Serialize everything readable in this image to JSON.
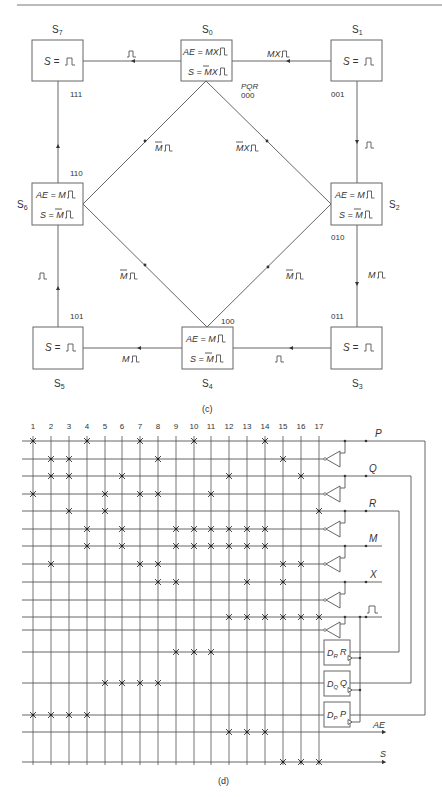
{
  "state_diagram": {
    "caption": "(c)",
    "code_header": "PQR",
    "states": [
      {
        "id": "S7",
        "name": "S",
        "sub": "7",
        "code": "111",
        "lines": [
          "S = ⎍"
        ],
        "x": 32,
        "y": 40,
        "name_pos": [
          57,
          30
        ],
        "code_pos": [
          70,
          95
        ]
      },
      {
        "id": "S0",
        "name": "S",
        "sub": "0",
        "code": "000",
        "lines": [
          "AE = MX⎍",
          "S = M̄X⎍"
        ],
        "x": 181,
        "y": 40,
        "name_pos": [
          206,
          30
        ],
        "code_pos": [
          240,
          95
        ]
      },
      {
        "id": "S1",
        "name": "S",
        "sub": "1",
        "code": "001",
        "lines": [
          "S = ⎍"
        ],
        "x": 331,
        "y": 40,
        "name_pos": [
          356,
          30
        ],
        "code_pos": [
          331,
          95
        ]
      },
      {
        "id": "S2",
        "name": "S",
        "sub": "2",
        "code": "010",
        "lines": [
          "AE = M⎍",
          "S = M̄⎍"
        ],
        "x": 331,
        "y": 183,
        "name_pos": [
          394,
          208
        ],
        "code_pos": [
          331,
          240
        ]
      },
      {
        "id": "S3",
        "name": "S",
        "sub": "3",
        "code": "011",
        "lines": [
          "S = ⎍"
        ],
        "x": 331,
        "y": 327,
        "name_pos": [
          356,
          385
        ],
        "code_pos": [
          331,
          318
        ]
      },
      {
        "id": "S4",
        "name": "S",
        "sub": "4",
        "code": "100",
        "lines": [
          "AE = M⎍",
          "S = M̄⎍"
        ],
        "x": 182,
        "y": 327,
        "name_pos": [
          206,
          385
        ],
        "code_pos": [
          221,
          322
        ]
      },
      {
        "id": "S5",
        "name": "S",
        "sub": "5",
        "code": "101",
        "lines": [
          "S = ⎍"
        ],
        "x": 33,
        "y": 327,
        "name_pos": [
          57,
          385
        ],
        "code_pos": [
          70,
          318
        ]
      },
      {
        "id": "S6",
        "name": "S",
        "sub": "6",
        "code": "110",
        "lines": [
          "AE = M⎍",
          "S = M̄⎍"
        ],
        "x": 32,
        "y": 183,
        "name_pos": [
          17,
          208
        ],
        "code_pos": [
          70,
          174
        ]
      }
    ],
    "transitions": [
      {
        "from": "S7",
        "to": "S0",
        "label": "⎍"
      },
      {
        "from": "S0",
        "to": "S1",
        "label": "MX⎍"
      },
      {
        "from": "S1",
        "to": "S2",
        "label": "⎍"
      },
      {
        "from": "S2",
        "to": "S3",
        "label": "M⎍"
      },
      {
        "from": "S3",
        "to": "S4",
        "label": "⎍"
      },
      {
        "from": "S4",
        "to": "S5",
        "label": "M⎍"
      },
      {
        "from": "S5",
        "to": "S6",
        "label": "⎍"
      },
      {
        "from": "S6",
        "to": "S7",
        "label": "⎍"
      },
      {
        "from": "S6",
        "to": "S0",
        "label": "M̄⎍"
      },
      {
        "from": "S2",
        "to": "S0",
        "label": "M̄X⎍"
      },
      {
        "from": "S4",
        "to": "S6",
        "label": "M̄⎍"
      },
      {
        "from": "S4",
        "to": "S2",
        "label": "M̄⎍"
      }
    ]
  },
  "crossbar": {
    "caption": "(d)",
    "columns": [
      "1",
      "2",
      "3",
      "4",
      "5",
      "6",
      "7",
      "8",
      "9",
      "10",
      "11",
      "12",
      "13",
      "14",
      "15",
      "16",
      "17"
    ],
    "rows": [
      {
        "name": "P",
        "crosses": [
          1,
          4,
          7,
          10,
          14
        ]
      },
      {
        "name": "P_bar",
        "crosses": [
          2,
          3,
          8,
          15
        ]
      },
      {
        "name": "Q",
        "crosses": [
          2,
          3,
          6,
          12,
          16
        ]
      },
      {
        "name": "Q_bar",
        "crosses": [
          1,
          5,
          7,
          8,
          11
        ]
      },
      {
        "name": "R",
        "crosses": [
          3,
          5,
          17
        ]
      },
      {
        "name": "R_bar",
        "crosses": [
          4,
          6,
          9,
          10,
          11,
          12,
          13,
          14
        ]
      },
      {
        "name": "M",
        "crosses": [
          4,
          6,
          9,
          10,
          11,
          12,
          13,
          14
        ]
      },
      {
        "name": "M_bar",
        "crosses": [
          2,
          7,
          8,
          15,
          16
        ]
      },
      {
        "name": "X",
        "crosses": [
          8,
          9,
          13,
          15
        ]
      },
      {
        "name": "X_bar",
        "crosses": []
      },
      {
        "name": "clock",
        "crosses": [
          12,
          13,
          14,
          15,
          16,
          17
        ]
      },
      {
        "name": "clock_bar",
        "crosses": []
      },
      {
        "name": "D_R",
        "crosses": [
          9,
          10,
          11
        ]
      },
      {
        "name": "D_Q",
        "crosses": [
          5,
          6,
          7,
          8
        ]
      },
      {
        "name": "D_P",
        "crosses": [
          1,
          2,
          3,
          4
        ]
      },
      {
        "name": "AE",
        "crosses": [
          12,
          13,
          14
        ]
      },
      {
        "name": "S",
        "crosses": [
          15,
          16,
          17
        ]
      }
    ],
    "input_labels": {
      "P": "P",
      "Q": "Q",
      "R": "R",
      "M": "M",
      "X": "X",
      "clock": "⎍"
    },
    "flip_flops": [
      {
        "d": "D",
        "d_sub": "R",
        "q": "R"
      },
      {
        "d": "D",
        "d_sub": "Q",
        "q": "Q"
      },
      {
        "d": "D",
        "d_sub": "P",
        "q": "P"
      }
    ],
    "outputs": [
      "AE",
      "S"
    ]
  }
}
